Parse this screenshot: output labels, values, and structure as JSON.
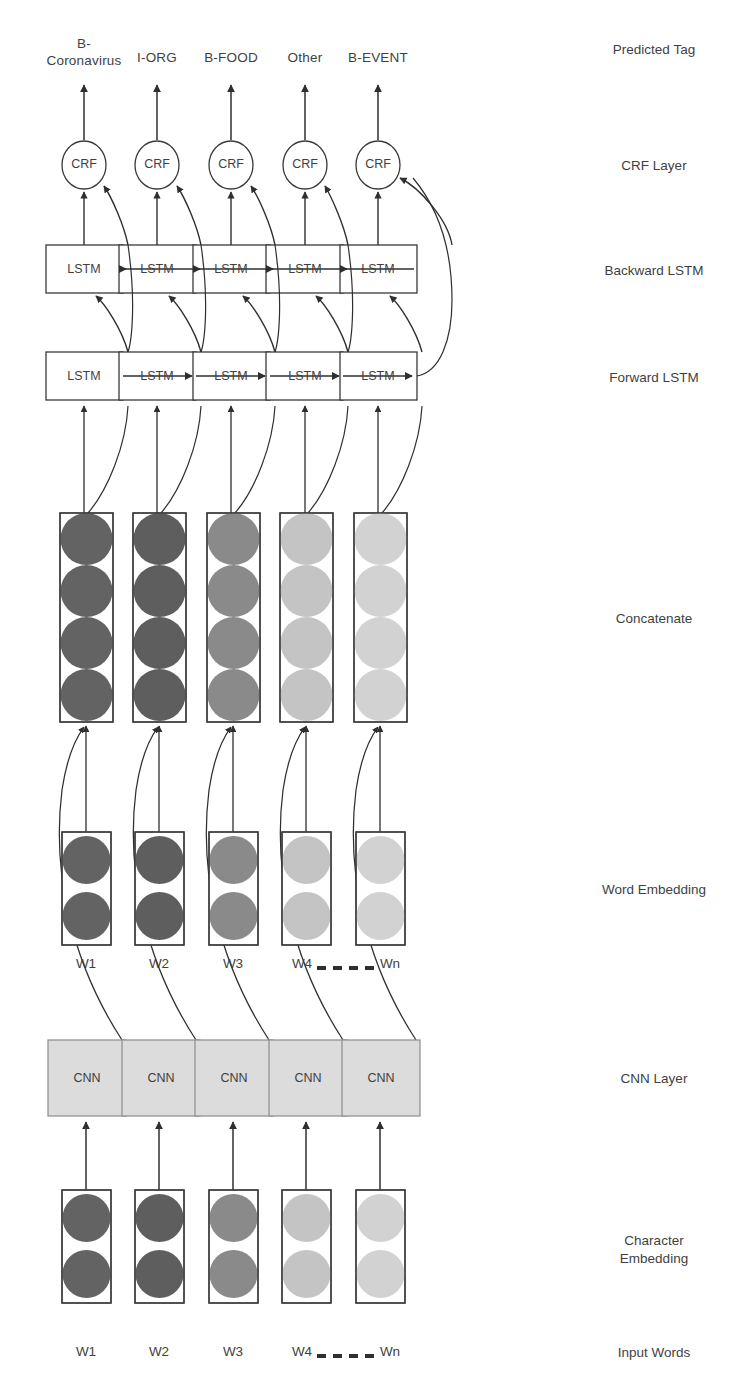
{
  "diagram": {
    "type": "neural-network-architecture",
    "columns": 5,
    "colors": {
      "shade_1": "#636363",
      "shade_2": "#5e5e5e",
      "shade_3": "#8a8a8a",
      "shade_4": "#c4c4c4",
      "shade_5": "#d2d2d2",
      "cnn_fill": "#dcdcdc",
      "stroke": "#3a3a3a",
      "background": "#ffffff"
    }
  },
  "row_labels": [
    {
      "id": "predicted-tag",
      "text": "Predicted Tag",
      "y": 48
    },
    {
      "id": "crf-layer",
      "text": "CRF Layer",
      "y": 158
    },
    {
      "id": "backward-lstm",
      "text": "Backward LSTM",
      "y": 263
    },
    {
      "id": "forward-lstm",
      "text": "Forward LSTM",
      "y": 368
    },
    {
      "id": "concatenate",
      "text": "Concatenate",
      "y": 611
    },
    {
      "id": "word-embedding",
      "text": "Word Embedding",
      "y": 882
    },
    {
      "id": "cnn-layer",
      "text": "CNN Layer",
      "y": 1077
    },
    {
      "id": "character-embedding",
      "text": "Character\nEmbedding",
      "y": 1247
    },
    {
      "id": "input-words",
      "text": "Input Words",
      "y": 1353
    }
  ],
  "predicted_tags": [
    {
      "text": "B-\nCoronavirus",
      "x": 84
    },
    {
      "text": "I-ORG",
      "x": 157
    },
    {
      "text": "B-FOOD",
      "x": 231
    },
    {
      "text": "Other",
      "x": 305
    },
    {
      "text": "B-EVENT",
      "x": 378
    }
  ],
  "crf_nodes": [
    {
      "label": "CRF",
      "x": 84
    },
    {
      "label": "CRF",
      "x": 157
    },
    {
      "label": "CRF",
      "x": 231
    },
    {
      "label": "CRF",
      "x": 305
    },
    {
      "label": "CRF",
      "x": 378
    }
  ],
  "backward_lstm_nodes": [
    {
      "label": "LSTM",
      "x": 84
    },
    {
      "label": "LSTM",
      "x": 157
    },
    {
      "label": "LSTM",
      "x": 231
    },
    {
      "label": "LSTM",
      "x": 305
    },
    {
      "label": "LSTM",
      "x": 378
    }
  ],
  "forward_lstm_nodes": [
    {
      "label": "LSTM",
      "x": 84
    },
    {
      "label": "LSTM",
      "x": 157
    },
    {
      "label": "LSTM",
      "x": 231
    },
    {
      "label": "LSTM",
      "x": 305
    },
    {
      "label": "LSTM",
      "x": 378
    }
  ],
  "concatenate_vectors": [
    {
      "x": 84,
      "circles": 4,
      "fill": "#636363"
    },
    {
      "x": 157,
      "circles": 4,
      "fill": "#5e5e5e"
    },
    {
      "x": 231,
      "circles": 4,
      "fill": "#8a8a8a"
    },
    {
      "x": 305,
      "circles": 4,
      "fill": "#c4c4c4"
    },
    {
      "x": 378,
      "circles": 4,
      "fill": "#d2d2d2"
    }
  ],
  "word_embedding_vectors": [
    {
      "x": 84,
      "circles": 2,
      "fill": "#636363"
    },
    {
      "x": 157,
      "circles": 2,
      "fill": "#5e5e5e"
    },
    {
      "x": 231,
      "circles": 2,
      "fill": "#8a8a8a"
    },
    {
      "x": 305,
      "circles": 2,
      "fill": "#c4c4c4"
    },
    {
      "x": 378,
      "circles": 2,
      "fill": "#d2d2d2"
    }
  ],
  "cnn_nodes": [
    {
      "label": "CNN",
      "x": 87
    },
    {
      "label": "CNN",
      "x": 161
    },
    {
      "label": "CNN",
      "x": 234
    },
    {
      "label": "CNN",
      "x": 308
    },
    {
      "label": "CNN",
      "x": 381
    }
  ],
  "character_embedding_vectors": [
    {
      "x": 84,
      "circles": 2,
      "fill": "#636363"
    },
    {
      "x": 157,
      "circles": 2,
      "fill": "#5e5e5e"
    },
    {
      "x": 231,
      "circles": 2,
      "fill": "#8a8a8a"
    },
    {
      "x": 305,
      "circles": 2,
      "fill": "#c4c4c4"
    },
    {
      "x": 378,
      "circles": 2,
      "fill": "#d2d2d2"
    }
  ],
  "word_labels_middle": [
    {
      "text": "W1",
      "x": 84
    },
    {
      "text": "W2",
      "x": 157
    },
    {
      "text": "W3",
      "x": 231
    },
    {
      "text": "W4",
      "x": 300
    },
    {
      "text": "Wn",
      "x": 388
    }
  ],
  "word_labels_bottom": [
    {
      "text": "W1",
      "x": 84
    },
    {
      "text": "W2",
      "x": 157
    },
    {
      "text": "W3",
      "x": 231
    },
    {
      "text": "W4",
      "x": 300
    },
    {
      "text": "Wn",
      "x": 388
    }
  ],
  "ellipsis": {
    "dash_count": 4,
    "text": "- - - -"
  }
}
